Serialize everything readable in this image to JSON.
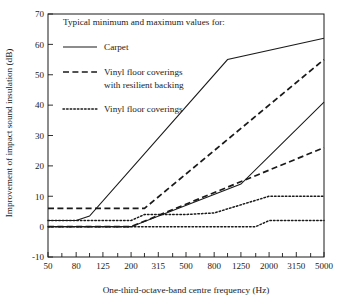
{
  "chart_data": {
    "type": "line",
    "title": "",
    "xlabel": "One-third-octave-band centre frequency (Hz)",
    "ylabel": "Improvement of impact sound insulation (dB)",
    "legend_title": "Typical minimum and maximum values for:",
    "legend_position": "inside-top-left",
    "grid": false,
    "xscale": "log",
    "xlim": [
      50,
      5000
    ],
    "ylim": [
      -10,
      70
    ],
    "ytick_interval": 10,
    "yticks": [
      "70",
      "60",
      "50",
      "40",
      "30",
      "20",
      "10",
      "0",
      "-10"
    ],
    "ytick_values": [
      70,
      60,
      50,
      40,
      30,
      20,
      10,
      0,
      -10
    ],
    "categories": [
      50,
      63,
      80,
      100,
      125,
      160,
      200,
      250,
      315,
      400,
      500,
      630,
      800,
      1000,
      1250,
      1600,
      2000,
      2500,
      3150,
      4000,
      5000
    ],
    "xtick_labels": [
      "50",
      "80",
      "125",
      "200",
      "315",
      "500",
      "800",
      "1250",
      "2000",
      "3150",
      "5000"
    ],
    "xtick_label_values": [
      50,
      80,
      125,
      200,
      315,
      500,
      800,
      1250,
      2000,
      3150,
      5000
    ],
    "xtick_minor_values": [
      63,
      100,
      160,
      250,
      400,
      630,
      1000,
      1600,
      2500,
      4000
    ],
    "series": [
      {
        "name": "Carpet",
        "style": "solid",
        "bound": "maximum",
        "x": [
          50,
          80,
          100,
          1000,
          5000
        ],
        "values": [
          2,
          2,
          3.5,
          55,
          62
        ]
      },
      {
        "name": "Carpet",
        "style": "solid",
        "bound": "minimum",
        "x": [
          50,
          200,
          1250,
          5000
        ],
        "values": [
          0,
          0,
          14,
          41
        ]
      },
      {
        "name": "Vinyl floor coverings with resilient backing",
        "style": "dashed",
        "bound": "maximum",
        "x": [
          50,
          250,
          5000
        ],
        "values": [
          6,
          6,
          55
        ]
      },
      {
        "name": "Vinyl floor coverings with resilient backing",
        "style": "dashed",
        "bound": "minimum",
        "x": [
          50,
          200,
          5000
        ],
        "values": [
          0,
          0,
          26
        ]
      },
      {
        "name": "Vinyl floor coverings",
        "style": "dotted",
        "bound": "maximum",
        "x": [
          50,
          200,
          250,
          500,
          800,
          2000,
          5000
        ],
        "values": [
          2,
          2,
          4,
          4,
          4.5,
          10,
          10
        ]
      },
      {
        "name": "Vinyl floor coverings",
        "style": "dotted",
        "bound": "minimum",
        "x": [
          50,
          1600,
          2000,
          5000
        ],
        "values": [
          0,
          0,
          2,
          2
        ]
      }
    ],
    "legend_entries": [
      {
        "label": "Carpet",
        "style": "solid",
        "label2": ""
      },
      {
        "label": "Vinyl floor coverings",
        "style": "dashed",
        "label2": "with resilient backing"
      },
      {
        "label": "Vinyl floor coverings",
        "style": "dotted",
        "label2": ""
      }
    ]
  }
}
